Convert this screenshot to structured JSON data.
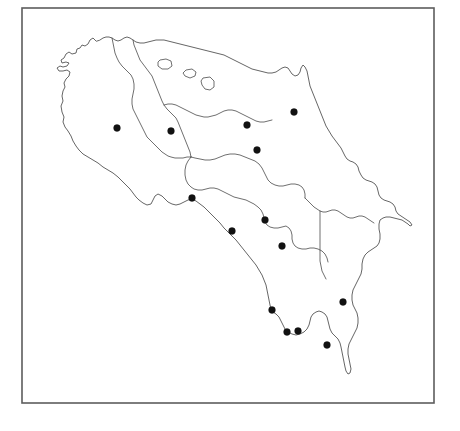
{
  "figure": {
    "kind": "outline-map",
    "region_name": "Costa Rica",
    "title": "",
    "caption": "",
    "width": 460,
    "height": 431,
    "background_color": "#ffffff"
  },
  "frame": {
    "name": "map-border-frame",
    "x": 22,
    "y": 8,
    "width": 412,
    "height": 395,
    "stroke_color": "#5d5d5d",
    "stroke_width": 1.6,
    "fill": "none"
  },
  "map": {
    "outline_stroke_color": "#4a4a4a",
    "outline_stroke_width": 0.85,
    "outline_fill": "#ffffff",
    "country_outline_path": "M 96,41 L 93,38 L 90,40 L 88,44 L 85,46 L 82,45 L 80,48 L 77,49 L 76,53 L 72,54 L 69,52 L 66,54 L 64,58 L 61,60 L 62,63 L 66,62 L 69,63 L 67,66 L 63,67 L 60,66 L 57,68 L 59,71 L 63,71 L 67,70 L 70,72 L 69,76 L 66,79 L 64,83 L 65,87 L 63,91 L 62,96 L 63,101 L 61,106 L 62,112 L 64,117 L 63,122 L 65,127 L 68,131 L 71,136 L 73,141 L 76,146 L 79,150 L 83,154 L 88,157 L 93,160 L 98,163 L 103,167 L 108,170 L 113,173 L 118,177 L 122,181 L 126,185 L 130,189 L 133,193 L 136,197 L 139,200 L 143,203 L 147,205 L 151,204 L 153,200 L 155,196 L 158,194 L 162,196 L 165,199 L 168,202 L 172,204 L 176,205 L 180,204 L 184,202 L 188,200 L 192,199 L 196,201 L 200,204 L 204,207 L 208,211 L 212,215 L 216,219 L 220,223 L 224,228 L 228,232 L 232,236 L 236,240 L 240,245 L 244,250 L 248,255 L 252,260 L 256,265 L 259,270 L 262,275 L 264,280 L 266,285 L 267,290 L 268,295 L 269,300 L 270,305 L 271,309 L 273,312 L 276,314 L 279,317 L 281,321 L 283,325 L 285,329 L 288,332 L 292,334 L 296,335 L 300,334 L 304,332 L 307,329 L 309,325 L 310,321 L 311,317 L 313,314 L 316,312 L 319,311 L 322,312 L 325,314 L 327,317 L 328,321 L 329,325 L 330,329 L 332,333 L 335,336 L 338,339 L 340,343 L 341,347 L 342,352 L 343,357 L 344,362 L 345,367 L 346,371 L 348,374 L 350,373 L 351,369 L 350,364 L 349,359 L 348,354 L 348,349 L 349,344 L 351,340 L 353,336 L 355,332 L 357,328 L 358,323 L 358,318 L 357,313 L 355,309 L 353,305 L 352,300 L 352,295 L 353,290 L 355,286 L 357,282 L 359,278 L 361,274 L 362,269 L 362,264 L 363,259 L 365,255 L 368,252 L 371,250 L 374,248 L 377,246 L 379,243 L 380,239 L 380,234 L 379,229 L 379,224 L 380,220 L 383,218 L 386,217 L 390,217 L 394,218 L 398,219 L 402,220 L 405,222 L 408,224 L 410,226 L 412,225 L 410,222 L 407,220 L 404,218 L 401,216 L 398,214 L 396,211 L 395,207 L 393,204 L 390,202 L 387,201 L 384,200 L 381,198 L 379,195 L 378,191 L 377,187 L 375,184 L 372,182 L 369,181 L 366,180 L 363,178 L 361,175 L 359,171 L 358,167 L 356,164 L 353,162 L 350,161 L 347,159 L 345,156 L 343,152 L 341,148 L 338,144 L 335,140 L 332,136 L 329,131 L 326,126 L 324,121 L 322,116 L 320,111 L 318,106 L 316,101 L 314,96 L 312,91 L 310,86 L 309,81 L 308,76 L 307,71 L 305,67 L 303,65 L 301,68 L 300,72 L 298,75 L 295,76 L 292,74 L 290,71 L 288,68 L 285,67 L 282,68 L 279,70 L 276,72 L 272,73 L 268,73 L 264,72 L 260,71 L 256,70 L 252,69 L 248,67 L 244,65 L 240,63 L 236,61 L 232,59 L 228,57 L 224,55 L 220,54 L 216,53 L 212,52 L 208,51 L 204,50 L 200,49 L 196,48 L 192,47 L 188,46 L 184,45 L 180,44 L 176,43 L 172,42 L 168,41 L 164,40 L 160,40 L 156,40 L 152,41 L 148,42 L 144,43 L 140,43 L 136,42 L 133,40 L 130,38 L 127,37 L 124,38 L 121,40 L 118,41 L 115,40 L 112,38 L 109,37 L 106,37 L 103,38 L 100,40 Z",
    "internal_boundaries": [
      "M 133,40 L 134,45 L 136,50 L 138,55 L 140,60 L 143,64 L 146,68 L 149,72 L 152,76 L 154,81 L 156,86 L 158,91 L 160,96 L 162,101 L 164,105 L 167,109 L 170,112 L 173,115 L 176,118 L 178,122 L 180,127 L 182,132 L 184,137 L 186,142 L 188,147 L 190,152 L 191,157",
      "M 191,157 L 195,158 L 200,159 L 205,160 L 210,160 L 215,159 L 220,157 L 225,155 L 230,154 L 235,154 L 240,155 L 245,157 L 250,159 L 255,161 L 259,164 L 262,168 L 264,172 L 266,176 L 268,180 L 271,183 L 275,185 L 279,186 L 283,186 L 287,185 L 291,184 L 295,184 L 299,185 L 302,187 L 304,190 L 305,194 L 305,198",
      "M 191,157 L 188,161 L 186,165 L 185,170 L 185,175 L 186,180 L 188,184 L 191,187 L 194,189 L 198,190 L 202,190 L 206,189 L 210,188 L 214,188 L 218,189 L 222,191 L 226,193 L 230,195 L 234,197 L 238,198 L 242,199 L 246,200 L 250,202 L 254,204 L 258,207 L 261,210 L 263,214 L 264,218 L 265,222 L 267,225 L 270,227 L 274,228 L 278,228 L 282,227 L 286,226 L 289,228 L 291,231 L 292,235 L 292,239 L 293,243 L 295,246 L 298,248 L 302,249 L 306,249 L 310,248 L 314,248 L 318,249 L 322,251 L 325,254 L 327,258 L 328,262",
      "M 305,198 L 308,201 L 311,204 L 314,207 L 317,209 L 320,211 L 323,212 L 326,212 L 329,211 L 332,210 L 335,210 L 338,211 L 341,213 L 344,215 L 347,217 L 350,218 L 353,218 L 356,217 L 359,216 L 362,216 L 365,217 L 368,219 L 371,221 L 374,223",
      "M 320,211 L 320,216 L 320,221 L 320,226 L 320,231 L 320,236 L 320,241 L 320,246 L 320,251 L 320,256 L 320,261 L 321,266 L 322,271 L 324,275 L 326,279",
      "M 112,38 L 113,43 L 114,48 L 115,53 L 117,58 L 119,62 L 122,66 L 125,69 L 128,72 L 131,75 L 133,79 L 134,84 L 134,89 L 133,94 L 132,99 L 132,104 L 133,109 L 135,113 L 137,117 L 139,121 L 141,125 L 143,129 L 145,133 L 147,137 L 150,140 L 153,143 L 156,146 L 159,149 L 162,152 L 165,154 L 168,156 L 171,157 L 175,158 L 179,158 L 183,158 L 187,157 L 191,157",
      "M 164,105 L 168,104 L 172,104 L 176,105 L 180,107 L 184,109 L 188,111 L 192,113 L 196,115 L 200,116 L 204,117 L 208,117 L 212,116 L 216,115 L 220,113 L 224,111 L 228,110 L 232,110 L 236,111 L 240,113 L 244,115 L 248,117 L 252,119 L 256,121 L 260,122 L 264,122 L 268,121 L 272,120"
    ],
    "islets": [
      "M 160,60 L 166,59 L 171,61 L 172,66 L 168,69 L 162,69 L 158,66 L 158,62 Z",
      "M 186,70 L 192,69 L 196,72 L 195,76 L 190,78 L 185,76 L 183,73 Z",
      "M 203,78 L 210,77 L 214,81 L 214,87 L 210,90 L 205,89 L 202,85 L 201,81 Z"
    ]
  },
  "markers": {
    "name": "sampling-site-markers",
    "count": 13,
    "color": "#111111",
    "radius": 3.4,
    "points": [
      {
        "id": "site-01",
        "x": 117,
        "y": 128
      },
      {
        "id": "site-02",
        "x": 171,
        "y": 131
      },
      {
        "id": "site-03",
        "x": 247,
        "y": 125
      },
      {
        "id": "site-04",
        "x": 294,
        "y": 112
      },
      {
        "id": "site-05",
        "x": 257,
        "y": 150
      },
      {
        "id": "site-06",
        "x": 192,
        "y": 198
      },
      {
        "id": "site-07",
        "x": 265,
        "y": 220
      },
      {
        "id": "site-08",
        "x": 232,
        "y": 231
      },
      {
        "id": "site-09",
        "x": 282,
        "y": 246
      },
      {
        "id": "site-10",
        "x": 272,
        "y": 310
      },
      {
        "id": "site-11",
        "x": 287,
        "y": 332
      },
      {
        "id": "site-12",
        "x": 298,
        "y": 331
      },
      {
        "id": "site-13",
        "x": 343,
        "y": 302
      },
      {
        "id": "site-14",
        "x": 327,
        "y": 345
      }
    ]
  },
  "legend": {
    "present": false,
    "entries": []
  },
  "axes": {
    "present": false,
    "tick_labels": []
  }
}
